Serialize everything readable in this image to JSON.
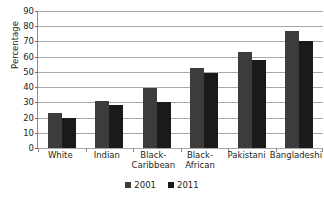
{
  "chart_data": {
    "type": "bar",
    "title": "",
    "xlabel": "",
    "ylabel": "Percentage",
    "ylim": [
      0,
      90
    ],
    "ytick_step": 10,
    "yticks": [
      "0",
      "10",
      "20",
      "30",
      "40",
      "50",
      "60",
      "70",
      "80",
      "90"
    ],
    "grid": true,
    "legend_position": "bottom-center",
    "categories": [
      "White",
      "Black-Caribbean",
      "Black-African",
      "Pakistani",
      "Bangladeshi",
      "Indian"
    ],
    "category_lines": [
      [
        "White"
      ],
      [
        "Indian"
      ],
      [
        "Black-",
        "Caribbean"
      ],
      [
        "Black-",
        "African"
      ],
      [
        "Pakistani"
      ],
      [
        "Bangladeshi"
      ]
    ],
    "series": [
      {
        "name": "2001",
        "color": "#3c3c3c",
        "values": [
          23,
          31,
          39.5,
          52.5,
          63,
          77
        ]
      },
      {
        "name": "2011",
        "color": "#1a1a1a",
        "values": [
          20,
          28.5,
          30.5,
          49,
          57.5,
          70.5
        ]
      }
    ]
  },
  "colors": {
    "gridline": "#a8a8a8",
    "axis": "#8d8d8d",
    "text": "#231f20",
    "background": "#ffffff"
  }
}
